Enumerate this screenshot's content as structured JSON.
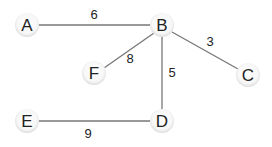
{
  "graph": {
    "nodes": [
      {
        "id": "A",
        "label": "A",
        "x": 27,
        "y": 25
      },
      {
        "id": "B",
        "label": "B",
        "x": 162,
        "y": 25
      },
      {
        "id": "F",
        "label": "F",
        "x": 94,
        "y": 73
      },
      {
        "id": "C",
        "label": "C",
        "x": 248,
        "y": 75
      },
      {
        "id": "E",
        "label": "E",
        "x": 27,
        "y": 121
      },
      {
        "id": "D",
        "label": "D",
        "x": 162,
        "y": 121
      }
    ],
    "edges": [
      {
        "from": "A",
        "to": "B",
        "weight": "6"
      },
      {
        "from": "B",
        "to": "F",
        "weight": "8"
      },
      {
        "from": "B",
        "to": "C",
        "weight": "3"
      },
      {
        "from": "B",
        "to": "D",
        "weight": "5"
      },
      {
        "from": "E",
        "to": "D",
        "weight": "9"
      }
    ]
  }
}
